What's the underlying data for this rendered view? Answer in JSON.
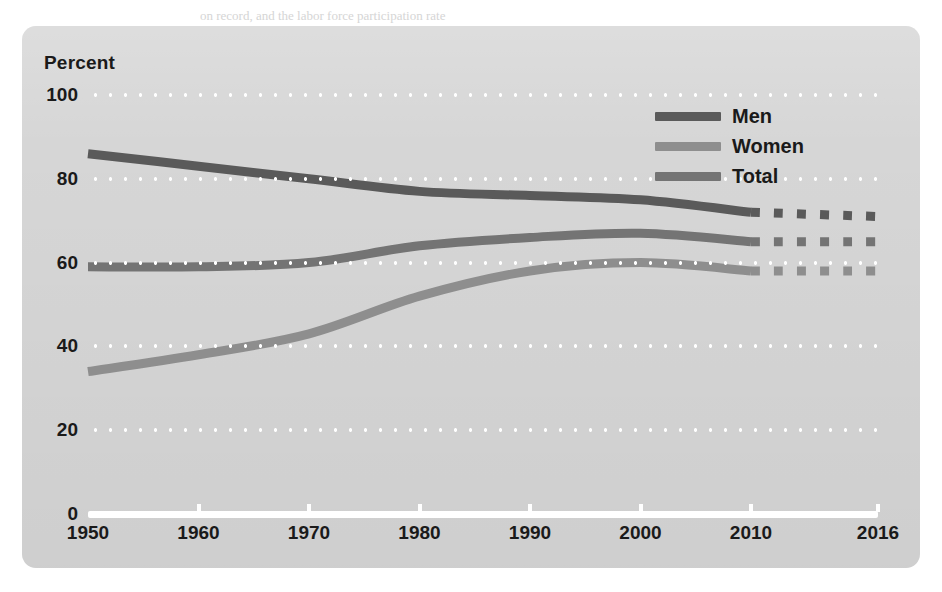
{
  "panel": {
    "axis_title": "Percent",
    "background_color": "#d6d6d6"
  },
  "legend": {
    "items": [
      {
        "label": "Men",
        "color": "#5a5a5a"
      },
      {
        "label": "Women",
        "color": "#8e8e8e"
      },
      {
        "label": "Total",
        "color": "#747474"
      }
    ]
  },
  "bleed_text": {
    "lines": [
      {
        "text": "on record, and the labor force participation rate",
        "x": 200,
        "y": 8
      },
      {
        "text": "declined to its lowest level since",
        "x": 300,
        "y": 26
      },
      {
        "text": "the recession began in 2007.",
        "x": 330,
        "y": 44
      },
      {
        "text": "for many people. Rates of unemployment",
        "x": 40,
        "y": 80
      },
      {
        "text": "began to fall, though the labor market",
        "x": 700,
        "y": 96
      },
      {
        "text": "remained uneven across regions.",
        "x": 60,
        "y": 200
      },
      {
        "text": "Among those who were out of work,",
        "x": 640,
        "y": 230
      },
      {
        "text": "the share of long-term unemployed",
        "x": 100,
        "y": 300
      },
      {
        "text": "workers stayed elevated, a sign that",
        "x": 620,
        "y": 316
      },
      {
        "text": "recovery had not reached everyone.",
        "x": 120,
        "y": 404
      },
      {
        "text": "participation was still well below its",
        "x": 660,
        "y": 420
      },
      {
        "text": "Source: U.S. Bureau of Labor Statistics",
        "x": 130,
        "y": 470
      },
      {
        "text": "measured by the civilian",
        "x": 150,
        "y": 492
      },
      {
        "text": "labor force participation rate.",
        "x": 330,
        "y": 510
      },
      {
        "text": "pre-recession peak.",
        "x": 350,
        "y": 532
      }
    ]
  },
  "chart_data": {
    "type": "line",
    "title": "",
    "xlabel": "",
    "ylabel": "Percent",
    "ylim": [
      0,
      100
    ],
    "yticks": [
      0,
      20,
      40,
      60,
      80,
      100
    ],
    "grid": "horizontal-dotted",
    "legend_position": "top-right",
    "x": [
      1950,
      1960,
      1970,
      1980,
      1990,
      2000,
      2010,
      2016
    ],
    "xticklabels": [
      "1950",
      "1960",
      "1970",
      "1980",
      "1990",
      "2000",
      "2010",
      "2016"
    ],
    "projected_from": 2010,
    "annotation": "Segment from 2010 to 2016 is drawn with a dashed line.",
    "series": [
      {
        "name": "Men",
        "color": "#5a5a5a",
        "values": [
          86,
          83,
          80,
          77,
          76,
          75,
          72,
          71
        ]
      },
      {
        "name": "Women",
        "color": "#8e8e8e",
        "values": [
          34,
          38,
          43,
          52,
          58,
          60,
          58,
          58
        ]
      },
      {
        "name": "Total",
        "color": "#747474",
        "values": [
          59,
          59,
          60,
          64,
          66,
          67,
          65,
          65
        ]
      }
    ]
  }
}
